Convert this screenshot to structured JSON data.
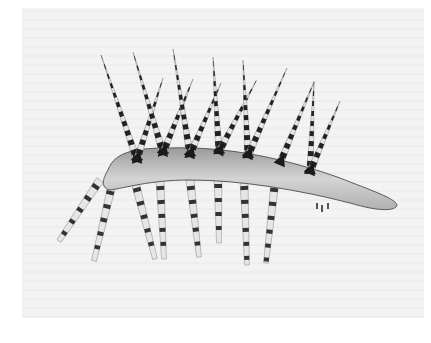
{
  "image": {
    "subject": "Hallucigenia reconstruction illustration",
    "style": "grayscale scanned drawing",
    "colors": {
      "background": "#ffffff",
      "page": "#f3f3f3",
      "ink_dark": "#1e1e1e",
      "ink_mid": "#6a6a6a",
      "body_fill": "#c9c9c9"
    }
  },
  "figure": {
    "spines": [
      {
        "base": [
          137,
          160
        ],
        "tip": [
          101,
          55
        ]
      },
      {
        "base": [
          137,
          160
        ],
        "tip": [
          163,
          78
        ]
      },
      {
        "base": [
          163,
          153
        ],
        "tip": [
          133,
          52
        ]
      },
      {
        "base": [
          163,
          153
        ],
        "tip": [
          193,
          79
        ]
      },
      {
        "base": [
          190,
          155
        ],
        "tip": [
          173,
          49
        ]
      },
      {
        "base": [
          190,
          155
        ],
        "tip": [
          221,
          83
        ]
      },
      {
        "base": [
          219,
          152
        ],
        "tip": [
          213,
          57
        ]
      },
      {
        "base": [
          219,
          152
        ],
        "tip": [
          256,
          81
        ]
      },
      {
        "base": [
          248,
          156
        ],
        "tip": [
          243,
          60
        ]
      },
      {
        "base": [
          248,
          156
        ],
        "tip": [
          287,
          68
        ]
      },
      {
        "base": [
          280,
          163
        ],
        "tip": [
          314,
          82
        ]
      },
      {
        "base": [
          310,
          172
        ],
        "tip": [
          314,
          82
        ]
      },
      {
        "base": [
          310,
          172
        ],
        "tip": [
          340,
          101
        ]
      }
    ],
    "legs": [
      {
        "base": [
          100,
          180
        ],
        "tip": [
          59,
          241
        ]
      },
      {
        "base": [
          112,
          185
        ],
        "tip": [
          94,
          261
        ]
      },
      {
        "base": [
          135,
          182
        ],
        "tip": [
          155,
          259
        ]
      },
      {
        "base": [
          160,
          180
        ],
        "tip": [
          164,
          259
        ]
      },
      {
        "base": [
          190,
          180
        ],
        "tip": [
          199,
          257
        ]
      },
      {
        "base": [
          218,
          178
        ],
        "tip": [
          219,
          243
        ]
      },
      {
        "base": [
          244,
          180
        ],
        "tip": [
          247,
          265
        ]
      },
      {
        "base": [
          275,
          182
        ],
        "tip": [
          266,
          263
        ]
      }
    ],
    "body_end": [
      395,
      207
    ]
  }
}
